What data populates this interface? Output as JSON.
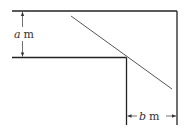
{
  "diagram": {
    "labels": {
      "a_var": "a",
      "a_unit": "m",
      "b_var": "b",
      "b_unit": "m"
    },
    "colors": {
      "stroke": "#222222",
      "rod": "#555555"
    }
  }
}
